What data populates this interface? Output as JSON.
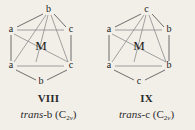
{
  "figure": {
    "background_color": "#f2efe9",
    "line_color": "#5e5e5e",
    "text_color": "#1d1d1d"
  },
  "diagrams": [
    {
      "id": "VIII",
      "roman_numeral": "VIII",
      "center_label": "M",
      "isomer_prefix": "trans-",
      "isomer_ligand": "b",
      "point_group_symbol": "C",
      "point_group_sub_number": "2",
      "point_group_sub_letter": "v",
      "open_paren": "(",
      "close_paren": ")",
      "vertices": [
        {
          "position": "top",
          "label": "b",
          "x": 48.5,
          "y": 10
        },
        {
          "position": "upper-left",
          "label": "a",
          "x": 11,
          "y": 30
        },
        {
          "position": "upper-right",
          "label": "c",
          "x": 71,
          "y": 30
        },
        {
          "position": "lower-left",
          "label": "a",
          "x": 11,
          "y": 66
        },
        {
          "position": "lower-right",
          "label": "c",
          "x": 71,
          "y": 66
        },
        {
          "position": "bottom",
          "label": "b",
          "x": 41,
          "y": 82
        }
      ]
    },
    {
      "id": "IX",
      "roman_numeral": "IX",
      "center_label": "M",
      "isomer_prefix": "trans-",
      "isomer_ligand": "c",
      "point_group_symbol": "C",
      "point_group_sub_number": "2",
      "point_group_sub_letter": "v",
      "open_paren": "(",
      "close_paren": ")",
      "vertices": [
        {
          "position": "top",
          "label": "c",
          "x": 48.5,
          "y": 10
        },
        {
          "position": "upper-left",
          "label": "a",
          "x": 11,
          "y": 30
        },
        {
          "position": "upper-right",
          "label": "b",
          "x": 71,
          "y": 30
        },
        {
          "position": "lower-left",
          "label": "a",
          "x": 11,
          "y": 66
        },
        {
          "position": "lower-right",
          "label": "b",
          "x": 71,
          "y": 66
        },
        {
          "position": "bottom",
          "label": "c",
          "x": 41,
          "y": 82
        }
      ]
    }
  ]
}
